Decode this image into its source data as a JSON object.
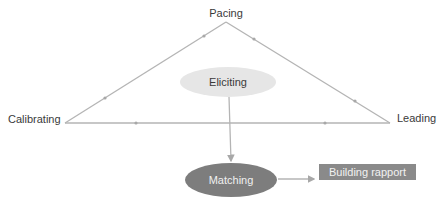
{
  "diagram": {
    "triangle": {
      "apex_top": {
        "label": "Pacing"
      },
      "vertex_left": {
        "label": "Calibrating"
      },
      "vertex_right": {
        "label": "Leading"
      }
    },
    "nodes": {
      "center": {
        "label": "Eliciting",
        "shape": "ellipse",
        "fill": "#e6e6e6"
      },
      "bottom": {
        "label": "Matching",
        "shape": "ellipse",
        "fill": "#7d7d7d"
      },
      "outcome": {
        "label": "Building rapport",
        "shape": "rectangle",
        "fill": "#8a8a8a"
      }
    },
    "edges": [
      {
        "from": "Calibrating",
        "to": "Pacing",
        "style": "line-with-arrow-markers"
      },
      {
        "from": "Pacing",
        "to": "Leading",
        "style": "line-with-arrow-markers"
      },
      {
        "from": "Leading",
        "to": "Calibrating",
        "style": "line-with-arrow-markers"
      },
      {
        "from": "Eliciting",
        "to": "Matching",
        "style": "arrow"
      },
      {
        "from": "Matching",
        "to": "Building rapport",
        "style": "arrow"
      }
    ],
    "colors": {
      "line": "#b4b4b4",
      "text": "#3a3a3a"
    }
  }
}
